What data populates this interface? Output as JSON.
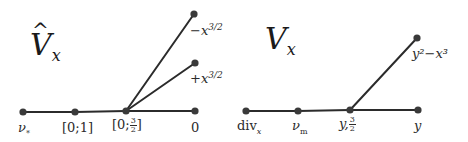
{
  "left_graph": {
    "title": "V",
    "title_hat": "^",
    "title_sub": "x",
    "nodes": [
      {
        "id": "nu-star",
        "label": "ν",
        "label_sub": "*",
        "x": 23,
        "y": 112
      },
      {
        "id": "zero-one",
        "label": "[0;1]",
        "x": 75,
        "y": 112
      },
      {
        "id": "zero-three-halves",
        "label_prefix": "[0;",
        "frac_num": "3",
        "frac_den": "2",
        "label_suffix": "]",
        "x": 126,
        "y": 111
      },
      {
        "id": "zero",
        "label": "0",
        "x": 195,
        "y": 111
      },
      {
        "id": "minus-x-three-halves",
        "label_base": "−x",
        "label_sup": "3/2",
        "x": 194,
        "y": 14
      },
      {
        "id": "plus-x-three-halves",
        "label_base": "+x",
        "label_sup": "3/2",
        "x": 195,
        "y": 63
      }
    ],
    "edges": [
      [
        "nu-star",
        "zero-one"
      ],
      [
        "zero-one",
        "zero-three-halves"
      ],
      [
        "zero-three-halves",
        "zero"
      ],
      [
        "zero-three-halves",
        "minus-x-three-halves"
      ],
      [
        "zero-three-halves",
        "plus-x-three-halves"
      ]
    ]
  },
  "right_graph": {
    "title": "V",
    "title_sub": "x",
    "nodes": [
      {
        "id": "div-x",
        "label": "div",
        "label_sub": "x",
        "x": 246,
        "y": 111
      },
      {
        "id": "nu-m",
        "label": "ν",
        "label_sub": "m",
        "x": 298,
        "y": 111
      },
      {
        "id": "y-three-halves",
        "label_prefix": "y,",
        "frac_num": "3",
        "frac_den": "2",
        "x": 350,
        "y": 110
      },
      {
        "id": "y",
        "label": "y",
        "x": 418,
        "y": 110
      },
      {
        "id": "y2-minus-x3",
        "label": "y²−x³",
        "x": 417,
        "y": 38
      }
    ],
    "edges": [
      [
        "div-x",
        "nu-m"
      ],
      [
        "nu-m",
        "y-three-halves"
      ],
      [
        "y-three-halves",
        "y"
      ],
      [
        "y-three-halves",
        "y2-minus-x3"
      ]
    ]
  },
  "colors": {
    "edge": "#2b2b2b",
    "node": "#3a3a3a",
    "text": "#2b2b2b",
    "background": "#ffffff"
  }
}
